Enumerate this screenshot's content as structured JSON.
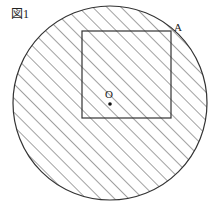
{
  "figure": {
    "label": "図1",
    "point_center_label": "O",
    "point_corner_label": "A",
    "colors": {
      "stroke": "#333333",
      "hatch": "#444444",
      "background": "#ffffff"
    }
  },
  "geometry": {
    "circle": {
      "cx": 110,
      "cy": 103,
      "r": 97
    },
    "square": {
      "x": 82,
      "y": 31,
      "width": 89,
      "height": 87
    },
    "center_point": {
      "x": 110,
      "y": 104
    },
    "hatch_spacing": 10,
    "hatch_angle_deg": 45
  }
}
